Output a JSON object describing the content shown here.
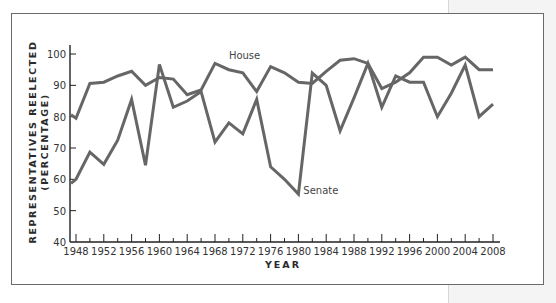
{
  "chart_data": {
    "type": "line",
    "title": "",
    "xlabel": "YEAR",
    "ylabel": "REPRESENTATIVES REELECTED",
    "ylabel_sub": "(PERCENTAGE)",
    "ylim": [
      40,
      100
    ],
    "xlim": [
      1946,
      2008
    ],
    "grid": false,
    "legend": "inline labels",
    "y_ticks": [
      40,
      50,
      60,
      70,
      80,
      90,
      100
    ],
    "x_tick_labels": [
      1948,
      1952,
      1956,
      1960,
      1964,
      1968,
      1972,
      1976,
      1980,
      1984,
      1988,
      1992,
      1996,
      2000,
      2004,
      2008
    ],
    "x": [
      1946,
      1948,
      1950,
      1952,
      1954,
      1956,
      1958,
      1960,
      1962,
      1964,
      1966,
      1968,
      1970,
      1972,
      1974,
      1976,
      1978,
      1980,
      1982,
      1984,
      1986,
      1988,
      1990,
      1992,
      1994,
      1996,
      1998,
      2000,
      2002,
      2004,
      2006,
      2008
    ],
    "series": [
      {
        "name": "House",
        "color": "#666666",
        "values": [
          80.6,
          79.5,
          90.6,
          91,
          93,
          94.5,
          90,
          92.5,
          92,
          87,
          88.5,
          97,
          95,
          94,
          88,
          96,
          94,
          91,
          90.6,
          94.5,
          98,
          98.5,
          97,
          89,
          91,
          94,
          99,
          99,
          96.5,
          99,
          95,
          95
        ]
      },
      {
        "name": "Senate",
        "color": "#666666",
        "values": [
          58.7,
          60,
          68.7,
          64.8,
          72.5,
          85.5,
          64.5,
          96.7,
          83,
          85,
          88,
          71.9,
          78,
          74.5,
          85.5,
          64,
          60,
          55.3,
          93.9,
          90,
          75.5,
          86,
          97,
          83,
          93,
          91,
          91,
          80,
          87.5,
          96.5,
          80,
          84
        ]
      }
    ],
    "annotations": [
      {
        "text": "House",
        "year": 1970,
        "value": 99
      },
      {
        "text": "Senate",
        "year": 1981,
        "value": 56
      }
    ]
  },
  "labels": {
    "x_axis": "YEAR",
    "y_axis_line1": "REPRESENTATIVES REELECTED",
    "y_axis_line2": "(PERCENTAGE)"
  }
}
